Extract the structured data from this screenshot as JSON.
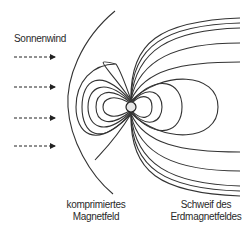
{
  "labels": {
    "solar_wind": "Sonnenwind",
    "compressed_line1": "komprimiertes",
    "compressed_line2": "Magnetfeld",
    "tail_line1": "Schweif des",
    "tail_line2": "Erdmagnetfeldes"
  },
  "colors": {
    "line": "#333333",
    "earth_fill": "#e6e6e6"
  }
}
